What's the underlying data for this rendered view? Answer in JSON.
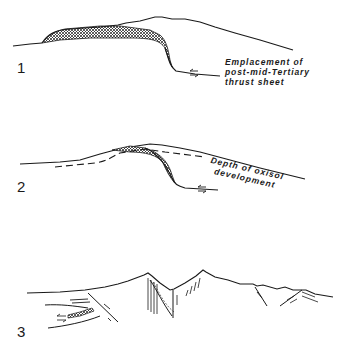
{
  "stages": [
    {
      "number": "1",
      "label_lines": [
        "Emplacement of",
        "post-mid-Tertiary",
        "thrust sheet"
      ]
    },
    {
      "number": "2",
      "label_lines": [
        "Depth of oxisol",
        "development"
      ]
    },
    {
      "number": "3",
      "label_lines": []
    }
  ],
  "colors": {
    "line": "#1a1a1a",
    "background": "#ffffff"
  }
}
